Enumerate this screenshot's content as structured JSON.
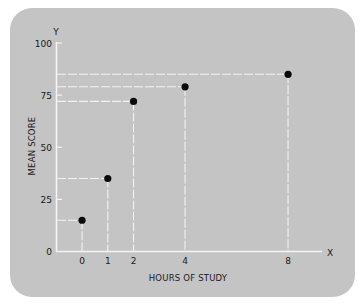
{
  "chart_data": {
    "type": "scatter",
    "title": "",
    "xlabel": "HOURS OF STUDY",
    "ylabel": "MEAN SCORE",
    "x_axis_letter": "X",
    "y_axis_letter": "Y",
    "x": [
      0,
      1,
      2,
      4,
      8
    ],
    "y": [
      15,
      35,
      72,
      79,
      85
    ],
    "x_ticks": [
      "0",
      "1",
      "2",
      "4",
      "8"
    ],
    "y_ticks": [
      "0",
      "25",
      "50",
      "75",
      "100"
    ],
    "ylim": [
      0,
      100
    ],
    "grid": false,
    "drop_lines": true,
    "colors": {
      "panel": "#c4c4c4",
      "axis": "#f4f4f4",
      "points": "#0a0a0a",
      "text": "#1a1a1a"
    }
  }
}
